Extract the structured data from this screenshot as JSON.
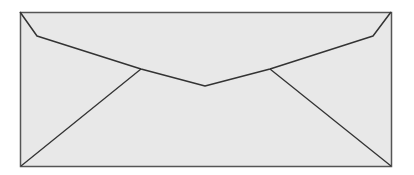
{
  "image": {
    "subject": "envelope",
    "description": "Back of a long business envelope with closed V-shaped flap",
    "colors": {
      "background": "#ffffff",
      "paper": "#e8e8e8",
      "outline": "#555555",
      "fold_lines": "#333333"
    },
    "geometry": {
      "outer": {
        "x1": 20,
        "y1": 12,
        "x2": 391,
        "y2": 166
      },
      "flap_points": [
        [
          20,
          12
        ],
        [
          37,
          36
        ],
        [
          141,
          69
        ],
        [
          205,
          86
        ],
        [
          270,
          69
        ],
        [
          373,
          36
        ],
        [
          391,
          12
        ]
      ],
      "left_fold": [
        [
          21,
          166
        ],
        [
          141,
          69
        ]
      ],
      "right_fold": [
        [
          391,
          166
        ],
        [
          270,
          69
        ]
      ]
    }
  }
}
